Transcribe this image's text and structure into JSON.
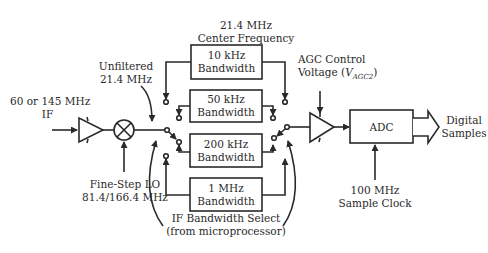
{
  "diagram": {
    "labels": {
      "center_freq_line1": "21.4 MHz",
      "center_freq_line2": "Center Frequency",
      "unfiltered_line1": "Unfiltered",
      "unfiltered_line2": "21.4 MHz",
      "if_in_line1": "60 or 145 MHz",
      "if_in_line2": "IF",
      "lo_line1": "Fine-Step LO",
      "lo_line2": "81.4/166.4 MHz",
      "bw_select_line1": "IF Bandwidth Select",
      "bw_select_line2": "(from microprocessor)",
      "agc_line1": "AGC Control",
      "agc_line2_prefix": "Voltage (",
      "agc_symbol": "V",
      "agc_subscript": "AGC2",
      "agc_line2_suffix": ")",
      "adc": "ADC",
      "digital_line1": "Digital",
      "digital_line2": "Samples",
      "clock_line1": "100 MHz",
      "clock_line2": "Sample Clock"
    },
    "filters": [
      {
        "line1": "10 kHz",
        "line2": "Bandwidth"
      },
      {
        "line1": "50 kHz",
        "line2": "Bandwidth"
      },
      {
        "line1": "200 kHz",
        "line2": "Bandwidth"
      },
      {
        "line1": "1 MHz",
        "line2": "Bandwidth"
      }
    ],
    "colors": {
      "line": "#2a2a2a",
      "background": "#ffffff"
    }
  }
}
